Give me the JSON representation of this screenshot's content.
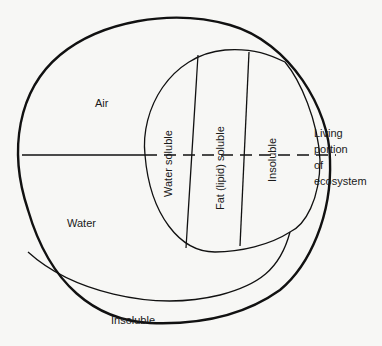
{
  "diagram": {
    "type": "compartment-diagram",
    "colors": {
      "line": "#111111",
      "background": "#f7f7f5",
      "text": "#1a1a1a"
    },
    "regions": {
      "air": "Air",
      "water": "Water",
      "bottom_insoluble": "Insoluble"
    },
    "living_compartments": [
      {
        "label": "Water soluble"
      },
      {
        "label": "Fat (lipid) soluble"
      },
      {
        "label": "Insoluble"
      }
    ],
    "side_label": {
      "lines": [
        "Living",
        "portion",
        "of",
        "ecosystem"
      ]
    }
  }
}
